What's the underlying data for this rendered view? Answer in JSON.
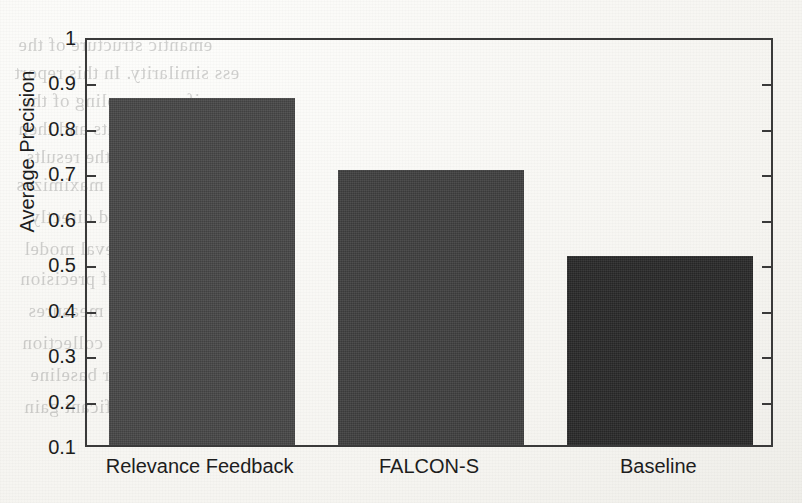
{
  "chart_data": {
    "type": "bar",
    "title": "",
    "subtitle": "",
    "xlabel": "",
    "ylabel": "Average Precision",
    "categories": [
      "Relevance Feedback",
      "FALCON-S",
      "Baseline"
    ],
    "values": [
      0.864,
      0.705,
      0.515
    ],
    "series": [
      {
        "name": "Average Precision",
        "values": [
          0.864,
          0.705,
          0.515
        ]
      }
    ],
    "bar_colors": [
      "#474747",
      "#404040",
      "#2a2a2a"
    ],
    "ylim": [
      0.1,
      1
    ],
    "xlim": [
      0,
      3
    ],
    "ytick_labels": [
      "1",
      "0.9",
      "0.8",
      "0.7",
      "0.6",
      "0.5",
      "0.4",
      "0.3",
      "0.2",
      "0.1"
    ],
    "ytick_values": [
      1,
      0.9,
      0.8,
      0.7,
      0.6,
      0.5,
      0.4,
      0.3,
      0.2,
      0.1
    ],
    "grid": false,
    "legend": "none",
    "frame": true,
    "ticks_inward": true,
    "ticks_both_sides": true
  },
  "figure": {
    "background_color": "#fbfbf8",
    "axis_color": "#3a3a3a",
    "text_color": "#1d1d1d",
    "ghost_fragments": [
      {
        "text": "emantic structure of the",
        "x": 18,
        "y": 34
      },
      {
        "text": "ess similarity.  In this report",
        "x": 14,
        "y": 62
      },
      {
        "text": "uniform sampling of the",
        "x": 22,
        "y": 90
      },
      {
        "text": "reject documents and then",
        "x": 18,
        "y": 118
      },
      {
        "text": "fusion of the results",
        "x": 26,
        "y": 146
      },
      {
        "text": "presentation that maximizes",
        "x": 16,
        "y": 174
      },
      {
        "text": "an be used directly",
        "x": 30,
        "y": 206
      },
      {
        "text": "the retrieval model",
        "x": 24,
        "y": 238
      },
      {
        "text": "aluation of precision",
        "x": 20,
        "y": 268
      },
      {
        "text": "recall measures",
        "x": 28,
        "y": 300
      },
      {
        "text": "in the collection",
        "x": 22,
        "y": 332
      },
      {
        "text": "over baseline",
        "x": 30,
        "y": 364
      },
      {
        "text": "significant gain",
        "x": 24,
        "y": 396
      }
    ]
  }
}
